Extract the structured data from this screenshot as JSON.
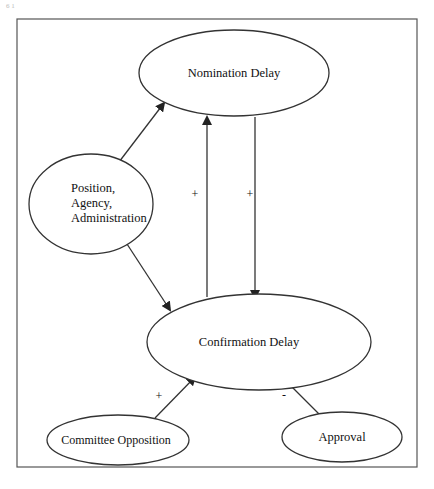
{
  "figure": {
    "corner_mark": "6 1",
    "frame": {
      "x": 17,
      "y": 19,
      "width": 400,
      "height": 448,
      "stroke": "#555555"
    }
  },
  "nodes": {
    "nomination": {
      "lines": [
        "Nomination Delay"
      ],
      "cx": 234,
      "cy": 73,
      "rx": 95,
      "ry": 43
    },
    "position": {
      "lines": [
        "Position,",
        "Agency,",
        "Administration"
      ],
      "cx": 91,
      "cy": 204,
      "rx": 62,
      "ry": 50
    },
    "confirmation": {
      "lines": [
        "Confirmation Delay"
      ],
      "cx": 259,
      "cy": 342,
      "rx": 112,
      "ry": 48
    },
    "committee": {
      "lines": [
        "Committee Opposition"
      ],
      "cx": 118,
      "cy": 440,
      "rx": 71,
      "ry": 25
    },
    "approval": {
      "lines": [
        "Approval"
      ],
      "cx": 342,
      "cy": 437,
      "rx": 60,
      "ry": 25
    }
  },
  "edges": [
    {
      "from": "position",
      "to": "nomination",
      "sign": ""
    },
    {
      "from": "position",
      "to": "confirmation",
      "sign": ""
    },
    {
      "from": "confirmation",
      "to": "nomination",
      "sign": "+"
    },
    {
      "from": "nomination",
      "to": "confirmation",
      "sign": "+"
    },
    {
      "from": "committee",
      "to": "confirmation",
      "sign": "+"
    },
    {
      "from": "approval",
      "to": "confirmation",
      "sign": "-"
    }
  ],
  "labels": {
    "sign_confirmation_to_nomination": "+",
    "sign_nomination_to_confirmation": "+",
    "sign_committee_to_confirmation": "+",
    "sign_approval_to_confirmation": "-"
  },
  "colors": {
    "stroke": "#333333",
    "text": "#111111",
    "background": "#ffffff"
  }
}
